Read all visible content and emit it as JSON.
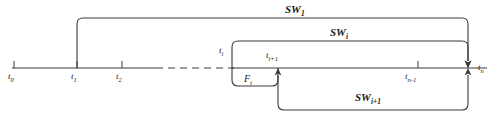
{
  "figure": {
    "type": "timeline-sliding-window-diagram",
    "stroke_color": "#3a3a3a",
    "text_color": "#1a1a1a",
    "background": "#ffffff"
  },
  "axis": {
    "name": "time-axis",
    "start_x": 12,
    "end_x": 487,
    "y": 68,
    "solid_segments": [
      [
        12,
        156
      ],
      [
        232,
        487
      ]
    ],
    "dashed_segment": [
      156,
      232
    ]
  },
  "ticks": [
    {
      "id": "t0",
      "label": "t",
      "sub": "0",
      "x": 14,
      "label_x": 10,
      "label_y": 72
    },
    {
      "id": "t1",
      "label": "t",
      "sub": "1",
      "x": 77,
      "label_x": 72,
      "label_y": 72
    },
    {
      "id": "t2",
      "label": "t",
      "sub": "2",
      "x": 122,
      "label_x": 117,
      "label_y": 72
    },
    {
      "id": "ti",
      "label": "t",
      "sub": "i",
      "x": 232,
      "label_x": 218,
      "label_y": 47
    },
    {
      "id": "ti1",
      "label": "t",
      "sub": "i+1",
      "x": 278,
      "label_x": 268,
      "label_y": 51
    },
    {
      "id": "tn1",
      "label": "t",
      "sub": "n-1",
      "x": 418,
      "label_x": 406,
      "label_y": 72
    },
    {
      "id": "tn",
      "label": "t",
      "sub": "n",
      "x": 468,
      "label_x": 478,
      "label_y": 64
    }
  ],
  "windows": [
    {
      "id": "sw1",
      "label": "SW",
      "sub": "1",
      "label_x": 288,
      "label_y": 5,
      "start_x": 77,
      "end_x": 468,
      "top_y": 18,
      "direction": "down"
    },
    {
      "id": "swi",
      "label": "SW",
      "sub": "i",
      "label_x": 330,
      "label_y": 31,
      "start_x": 232,
      "end_x": 468,
      "top_y": 41,
      "direction": "down"
    },
    {
      "id": "swi1",
      "label": "SW",
      "sub": "i+1",
      "label_x": 358,
      "label_y": 95,
      "start_x": 278,
      "end_x": 468,
      "bottom_y": 110,
      "direction": "up"
    }
  ],
  "frame": {
    "id": "fi",
    "label": "F",
    "sub": "i",
    "label_x": 245,
    "label_y": 76,
    "start_x": 232,
    "end_x": 278,
    "bottom_y": 86
  }
}
